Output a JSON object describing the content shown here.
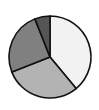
{
  "chart_data": {
    "type": "pie",
    "title": "",
    "categories": [
      "Slice A",
      "Slice B",
      "Slice C",
      "Slice D"
    ],
    "values": [
      39,
      30,
      25,
      6
    ],
    "colors": [
      "#f2f2f2",
      "#b3b3b3",
      "#808080",
      "#555555"
    ],
    "start_angle_deg": 0,
    "direction": "clockwise",
    "legend": "none",
    "labels_shown": false
  },
  "style": {
    "edge_color": "#111111",
    "center": [
      50,
      57
    ],
    "radius": 41
  }
}
